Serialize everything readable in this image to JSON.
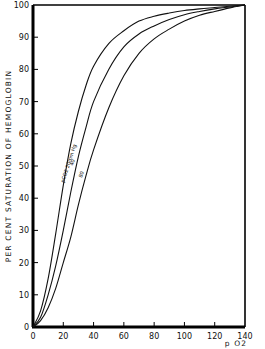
{
  "chart_data": {
    "type": "line",
    "title": "",
    "xlabel": "p O2",
    "ylabel": "PER CENT SATURATION OF HEMOGLOBIN",
    "xlim": [
      0,
      140
    ],
    "ylim": [
      0,
      100
    ],
    "x_ticks": [
      0,
      20,
      40,
      60,
      80,
      100,
      120,
      140
    ],
    "y_ticks": [
      0,
      10,
      20,
      30,
      40,
      50,
      60,
      70,
      80,
      90,
      100
    ],
    "grid": false,
    "legend": "inline labels on curves",
    "x": [
      0,
      5,
      10,
      15,
      20,
      25,
      30,
      35,
      40,
      50,
      60,
      70,
      80,
      90,
      100,
      110,
      120,
      130,
      140
    ],
    "series": [
      {
        "name": "pCO2 20 mm Hg",
        "label": "pCO2 20mm Hg",
        "values": [
          0,
          5,
          15,
          29,
          44,
          57,
          67,
          75,
          81,
          88,
          92,
          95,
          96.5,
          97.5,
          98.3,
          98.8,
          99.2,
          99.6,
          100
        ]
      },
      {
        "name": "pCO2 40",
        "label": "40",
        "values": [
          0,
          3,
          10,
          19,
          30,
          42,
          53,
          62,
          70,
          80,
          87,
          91,
          93.5,
          95.5,
          97,
          98,
          98.8,
          99.4,
          100
        ]
      },
      {
        "name": "pCO2 80",
        "label": "80",
        "values": [
          0,
          2,
          6,
          12,
          20,
          28,
          38,
          47,
          55,
          68,
          78,
          85,
          89.5,
          92.5,
          95,
          96.8,
          98,
          99.1,
          100
        ]
      }
    ]
  }
}
